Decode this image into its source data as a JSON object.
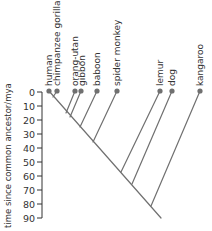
{
  "diagram": {
    "type": "phylogenetic-tree",
    "axis": {
      "label": "time since common ancestor/mya",
      "ticks": [
        "0",
        "10",
        "20",
        "30",
        "40",
        "50",
        "60",
        "70",
        "80",
        "90"
      ]
    },
    "taxa": [
      {
        "name": "human",
        "x": 49
      },
      {
        "name": "chimpanzee gorilla",
        "x": 57
      },
      {
        "name": "orang-utan",
        "x": 75
      },
      {
        "name": "gibbon",
        "x": 81
      },
      {
        "name": "baboon",
        "x": 97
      },
      {
        "name": "spider monkey",
        "x": 117
      },
      {
        "name": "lemur",
        "x": 160
      },
      {
        "name": "dog",
        "x": 172
      },
      {
        "name": "kangaroo",
        "x": 200
      }
    ],
    "colors": {
      "branch": "#707070",
      "node": "#707070",
      "text": "#333333"
    }
  }
}
